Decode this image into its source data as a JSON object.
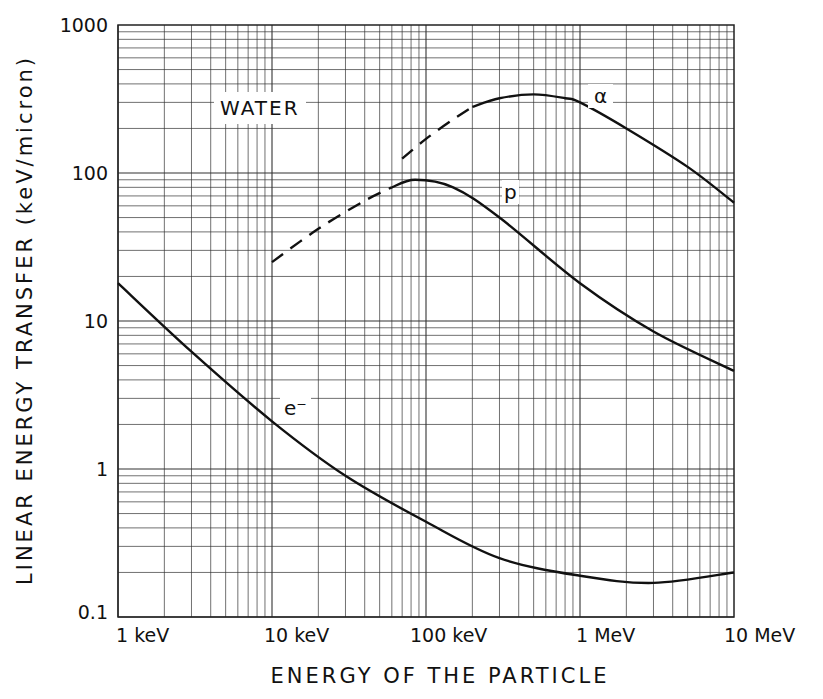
{
  "chart_data": {
    "type": "line",
    "title": "",
    "xlabel": "ENERGY OF THE PARTICLE",
    "ylabel": "LINEAR ENERGY TRANSFER (keV/micron)",
    "xscale": "log",
    "yscale": "log",
    "xlim_keV": [
      1,
      10000
    ],
    "ylim": [
      0.1,
      1000
    ],
    "x_tick_labels": [
      "1 keV",
      "10 keV",
      "100 keV",
      "1 MeV",
      "10 MeV"
    ],
    "x_tick_values_keV": [
      1,
      10,
      100,
      1000,
      10000
    ],
    "y_tick_labels": [
      "0.1",
      "1",
      "10",
      "100",
      "1000"
    ],
    "y_tick_values": [
      0.1,
      1,
      10,
      100,
      1000
    ],
    "grid": true,
    "annotation": "WATER",
    "series": [
      {
        "name": "e-",
        "label": "e⁻",
        "style": "solid",
        "x_keV": [
          1,
          3,
          10,
          30,
          100,
          300,
          1000,
          3000,
          10000
        ],
        "y": [
          18,
          6.2,
          2.1,
          0.9,
          0.44,
          0.25,
          0.19,
          0.17,
          0.2
        ]
      },
      {
        "name": "p",
        "label": "p",
        "style": "dashed-then-solid",
        "dashed_x_keV": [
          10,
          20,
          40,
          60
        ],
        "dashed_y": [
          25,
          42,
          65,
          80
        ],
        "x_keV": [
          60,
          85,
          150,
          300,
          1000,
          3000,
          10000
        ],
        "y": [
          80,
          90,
          80,
          50,
          18,
          8.5,
          4.6
        ]
      },
      {
        "name": "alpha",
        "label": "α",
        "style": "dashed-then-solid",
        "dashed_x_keV": [
          70,
          100,
          150,
          200
        ],
        "dashed_y": [
          125,
          170,
          230,
          280
        ],
        "x_keV": [
          200,
          300,
          500,
          800,
          1000,
          2000,
          5000,
          10000
        ],
        "y": [
          280,
          320,
          340,
          320,
          300,
          200,
          110,
          63
        ]
      }
    ]
  },
  "labels": {
    "water": "WATER",
    "alpha": "α",
    "proton": "p",
    "electron": "e⁻",
    "ylabel": "LINEAR ENERGY TRANSFER (keV/micron)",
    "xlabel": "ENERGY OF THE PARTICLE",
    "yticks": [
      "0.1",
      "1",
      "10",
      "100",
      "1000"
    ],
    "xticks": [
      "1 keV",
      "10 keV",
      "100 keV",
      "1 MeV",
      "10 MeV"
    ]
  }
}
